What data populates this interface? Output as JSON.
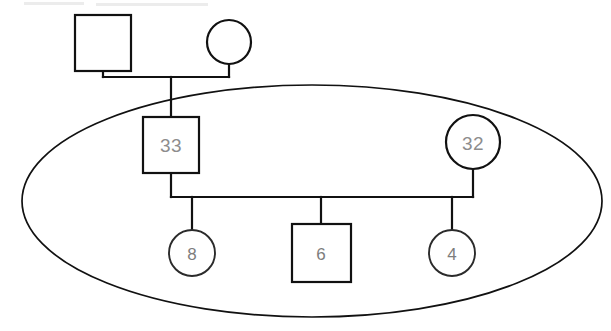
{
  "diagram": {
    "type": "genogram",
    "canvas": {
      "width": 611,
      "height": 331
    },
    "colors": {
      "stroke": "#111111",
      "background": "#ffffff",
      "label_text": "#8d8d8d"
    },
    "household_boundary": {
      "name": "household-ellipse",
      "shape": "ellipse",
      "cx": 312,
      "cy": 201,
      "rx": 290,
      "ry": 116
    },
    "nodes": [
      {
        "id": "grandfather",
        "name": "grandfather-square",
        "shape": "square",
        "gender": "male",
        "label": "",
        "x": 75,
        "y": 15,
        "width": 56,
        "height": 56
      },
      {
        "id": "grandmother",
        "name": "grandmother-circle",
        "shape": "circle",
        "gender": "female",
        "label": "",
        "cx": 229,
        "cy": 42,
        "r": 22
      },
      {
        "id": "father",
        "name": "father-square",
        "shape": "square",
        "gender": "male",
        "label": "33",
        "x": 143,
        "y": 117,
        "width": 56,
        "height": 56
      },
      {
        "id": "mother",
        "name": "mother-circle",
        "shape": "circle",
        "gender": "female",
        "label": "32",
        "cx": 473,
        "cy": 142,
        "r": 27
      },
      {
        "id": "child-1",
        "name": "child-circle-8",
        "shape": "circle",
        "gender": "female",
        "label": "8",
        "cx": 192,
        "cy": 253,
        "r": 23
      },
      {
        "id": "child-2",
        "name": "child-square-6",
        "shape": "square",
        "gender": "male",
        "label": "6",
        "x": 292,
        "y": 224,
        "width": 59,
        "height": 58
      },
      {
        "id": "child-3",
        "name": "child-circle-4",
        "shape": "circle",
        "gender": "female",
        "label": "4",
        "cx": 452,
        "cy": 253,
        "r": 23
      }
    ],
    "labels": {
      "father_age": "33",
      "mother_age": "32",
      "child_1_age": "8",
      "child_2_age": "6",
      "child_3_age": "4"
    },
    "connections": [
      {
        "name": "grandparents-union-line",
        "from": "grandfather",
        "to": "grandmother",
        "y": 77
      },
      {
        "name": "father-descent-line",
        "from": "grandparents-union",
        "to": "father",
        "x": 171
      },
      {
        "name": "parents-union-line",
        "from": "father",
        "to": "mother",
        "y": 197
      },
      {
        "name": "child-1-descent-line",
        "to": "child-1",
        "x": 192
      },
      {
        "name": "child-2-descent-line",
        "to": "child-2",
        "x": 321
      },
      {
        "name": "child-3-descent-line",
        "to": "child-3",
        "x": 452
      }
    ]
  }
}
